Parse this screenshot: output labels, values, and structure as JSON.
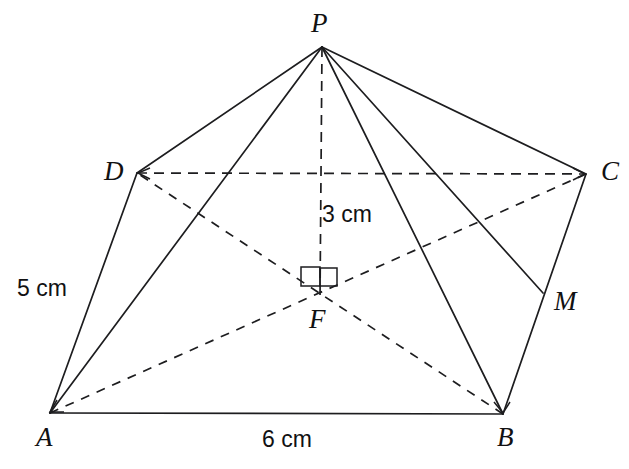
{
  "figure": {
    "type": "geometry-diagram",
    "background_color": "#ffffff",
    "stroke_color": "#1d1d1f"
  },
  "vertices": [
    {
      "id": "P",
      "label": "P",
      "x": 322,
      "y": 47,
      "label_x": 311,
      "label_y": 10,
      "role": "apex"
    },
    {
      "id": "D",
      "label": "D",
      "x": 137,
      "y": 173,
      "label_x": 104,
      "label_y": 158,
      "role": "base-corner"
    },
    {
      "id": "C",
      "label": "C",
      "x": 586,
      "y": 174,
      "label_x": 601,
      "label_y": 158,
      "role": "base-corner"
    },
    {
      "id": "A",
      "label": "A",
      "x": 50,
      "y": 413,
      "label_x": 36,
      "label_y": 424,
      "role": "base-corner"
    },
    {
      "id": "B",
      "label": "B",
      "x": 503,
      "y": 414,
      "label_x": 497,
      "label_y": 424,
      "role": "base-corner"
    },
    {
      "id": "M",
      "label": "M",
      "x": 543,
      "y": 293,
      "label_x": 554,
      "label_y": 288,
      "role": "edge-midpoint"
    },
    {
      "id": "F",
      "label": "F",
      "x": 320,
      "y": 285,
      "label_x": 309,
      "label_y": 306,
      "role": "base-centre"
    }
  ],
  "edges": [
    {
      "id": "PD",
      "from": "P",
      "to": "D",
      "style": "solid",
      "name": "lateral-edge-pd"
    },
    {
      "id": "PA",
      "from": "P",
      "to": "A",
      "style": "solid",
      "name": "lateral-edge-pa"
    },
    {
      "id": "PB",
      "from": "P",
      "to": "B",
      "style": "solid",
      "name": "lateral-edge-pb"
    },
    {
      "id": "PC",
      "from": "P",
      "to": "C",
      "style": "solid",
      "name": "lateral-edge-pc"
    },
    {
      "id": "PM",
      "from": "P",
      "to": "M",
      "style": "solid",
      "name": "slant-height-pm"
    },
    {
      "id": "AB",
      "from": "A",
      "to": "B",
      "style": "solid",
      "name": "base-edge-ab"
    },
    {
      "id": "AD",
      "from": "A",
      "to": "D",
      "style": "solid",
      "name": "base-edge-ad"
    },
    {
      "id": "BC",
      "from": "B",
      "to": "C",
      "style": "solid",
      "name": "base-edge-bc"
    },
    {
      "id": "DC",
      "from": "D",
      "to": "C",
      "style": "dashed",
      "name": "base-edge-dc-hidden"
    },
    {
      "id": "AC",
      "from": "A",
      "to": "C",
      "style": "dashed",
      "name": "base-diagonal-ac"
    },
    {
      "id": "BD",
      "from": "B",
      "to": "D",
      "style": "dashed",
      "name": "base-diagonal-bd"
    },
    {
      "id": "PF",
      "from": "P",
      "to": "F",
      "style": "dashed",
      "name": "pyramid-height-pf"
    }
  ],
  "right_angle_marks": [
    {
      "id": "left",
      "name": "right-angle-mark-left",
      "x": 301,
      "y": 267,
      "size": 19
    },
    {
      "id": "right",
      "name": "right-angle-mark-right",
      "x": 320,
      "y": 267,
      "size": 17
    }
  ],
  "dimensions": [
    {
      "id": "height",
      "label": "3 cm",
      "x": 322,
      "y": 203,
      "measures": "PF",
      "name": "dimension-label-height"
    },
    {
      "id": "slant-edge",
      "label": "5 cm",
      "x": 17,
      "y": 277,
      "measures": "AD",
      "name": "dimension-label-slant-edge"
    },
    {
      "id": "base",
      "label": "6 cm",
      "x": 262,
      "y": 428,
      "measures": "AB",
      "name": "dimension-label-base"
    }
  ]
}
